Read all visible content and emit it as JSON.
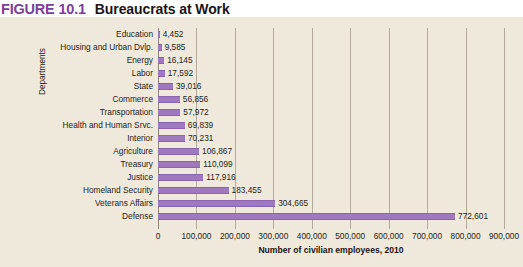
{
  "header": {
    "figure_number": "FIGURE 10.1",
    "title": "Bureaucrats at Work"
  },
  "colors": {
    "accent": "#7b3f98",
    "bar": "#9f79bd",
    "bar_edge": "#8d62ae",
    "background": "#efe9dc",
    "gridline": "#b3aa9b",
    "text": "#231c17"
  },
  "chart_data": {
    "type": "bar",
    "orientation": "horizontal",
    "title": "Bureaucrats at Work",
    "xlabel": "Number of civilian employees, 2010",
    "ylabel": "Departments",
    "xlim": [
      0,
      900000
    ],
    "xticks": [
      "0",
      "100,000",
      "200,000",
      "300,000",
      "400,000",
      "500,000",
      "600,000",
      "700,000",
      "800,000",
      "900,000"
    ],
    "xtick_values": [
      0,
      100000,
      200000,
      300000,
      400000,
      500000,
      600000,
      700000,
      800000,
      900000
    ],
    "grid": true,
    "legend": false,
    "categories": [
      "Education",
      "Housing and Urban Dvlp.",
      "Energy",
      "Labor",
      "State",
      "Commerce",
      "Transportation",
      "Health and Human Srvc.",
      "Interior",
      "Agriculture",
      "Treasury",
      "Justice",
      "Homeland Security",
      "Veterans Affairs",
      "Defense"
    ],
    "values": [
      4452,
      9585,
      16145,
      17592,
      39016,
      56856,
      57972,
      69839,
      70231,
      106867,
      110099,
      117916,
      183455,
      304665,
      772601
    ],
    "value_labels": [
      "4,452",
      "9,585",
      "16,145",
      "17,592",
      "39,016",
      "56,856",
      "57,972",
      "69,839",
      "70,231",
      "106,867",
      "110,099",
      "117,916",
      "183,455",
      "304,665",
      "772,601"
    ]
  }
}
